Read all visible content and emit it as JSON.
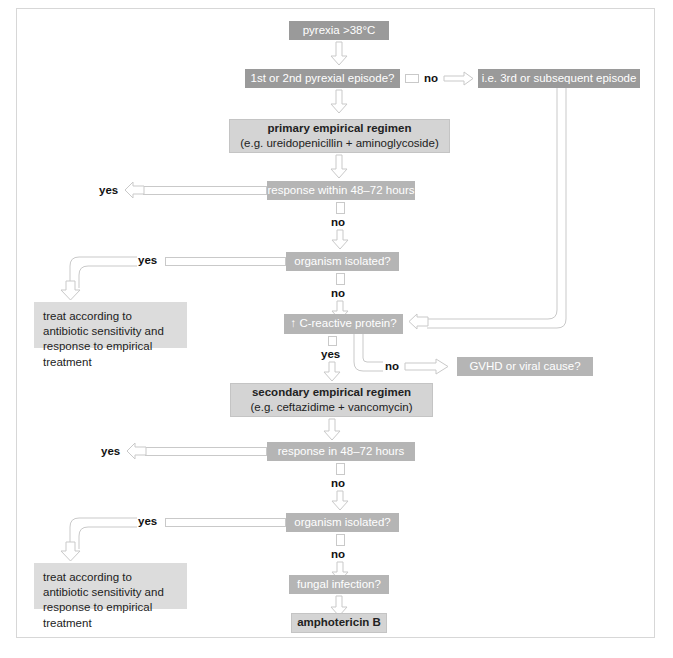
{
  "diagram": {
    "colors": {
      "node_dark": "#9a9a9a",
      "node_mid": "#b5b5b5",
      "node_light": "#d4d4d4",
      "node_pale": "#dcdcdc",
      "connector": "#c9c9c9",
      "frame": "#d7d7d7",
      "text_dark": "#1a1a1a"
    },
    "nodes": {
      "pyrexia": "pyrexia  >38°C",
      "episode_question": "1st or 2nd pyrexial episode?",
      "third_episode": "i.e. 3rd or subsequent episode",
      "primary_regimen_title": "primary empirical regimen",
      "primary_regimen_sub": "(e.g. ureidopenicillin + aminoglycoside)",
      "response_48_72_first": "response within 48–72 hours",
      "organism_isolated_first": "organism isolated?",
      "treat_accordingly_first": "treat according to antibiotic sensitivity and response to empirical treatment",
      "crp_question": "↑ C-reactive protein?",
      "gvhd_question": "GVHD or viral cause?",
      "secondary_regimen_title": "secondary empirical regimen",
      "secondary_regimen_sub": "(e.g. ceftazidime + vancomycin)",
      "response_48_72_second": "response in 48–72 hours",
      "organism_isolated_second": "organism isolated?",
      "treat_accordingly_second": "treat according to antibiotic sensitivity and response to empirical treatment",
      "fungal_question": "fungal infection?",
      "amphotericin": "amphotericin B"
    },
    "labels": {
      "no_episode": "no",
      "yes_response_first": "yes",
      "no_response_first": "no",
      "yes_organism_first": "yes",
      "no_organism_first": "no",
      "yes_crp": "yes",
      "no_crp": "no",
      "yes_response_second": "yes",
      "no_response_second": "no",
      "yes_organism_second": "yes",
      "no_organism_second": "no"
    },
    "caption": ""
  }
}
